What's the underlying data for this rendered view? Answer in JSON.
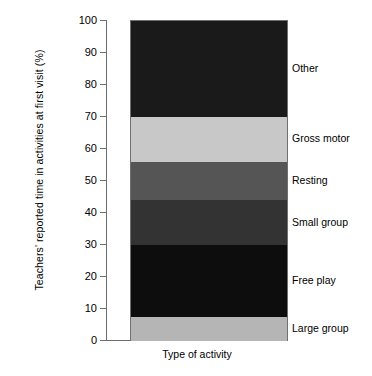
{
  "chart_data": {
    "type": "bar",
    "subtype": "stacked-bar-single-category",
    "title": "",
    "xlabel": "Type of activity",
    "ylabel": "Teachers' reported time in activities at first visit (%)",
    "ylim": [
      0,
      100
    ],
    "yticks": [
      0,
      10,
      20,
      30,
      40,
      50,
      60,
      70,
      80,
      90,
      100
    ],
    "ytick_labels": [
      "0",
      "10",
      "20",
      "30",
      "40",
      "50",
      "60",
      "70",
      "80",
      "90",
      "100"
    ],
    "grid": false,
    "legend_position": "right-inline-labels",
    "categories": [
      "Type of activity"
    ],
    "stack_order_bottom_to_top": [
      "Large group",
      "Free play",
      "Small group",
      "Resting",
      "Gross motor",
      "Other"
    ],
    "series": [
      {
        "name": "Large group",
        "values": [
          7.5
        ],
        "start": 0,
        "end": 7.5,
        "color": "#b5b5b5",
        "label_at": 3.8
      },
      {
        "name": "Free play",
        "values": [
          22.5
        ],
        "start": 7.5,
        "end": 30,
        "color": "#0d0d0d",
        "label_at": 18.8
      },
      {
        "name": "Small group",
        "values": [
          14
        ],
        "start": 30,
        "end": 44,
        "color": "#333333",
        "label_at": 37.0
      },
      {
        "name": "Resting",
        "values": [
          12
        ],
        "start": 44,
        "end": 56,
        "color": "#555555",
        "label_at": 50.0
      },
      {
        "name": "Gross motor",
        "values": [
          14
        ],
        "start": 56,
        "end": 70,
        "color": "#c8c8c8",
        "label_at": 63.0
      },
      {
        "name": "Other",
        "values": [
          30
        ],
        "start": 70,
        "end": 100,
        "color": "#1a1a1a",
        "label_at": 85.0
      }
    ]
  }
}
